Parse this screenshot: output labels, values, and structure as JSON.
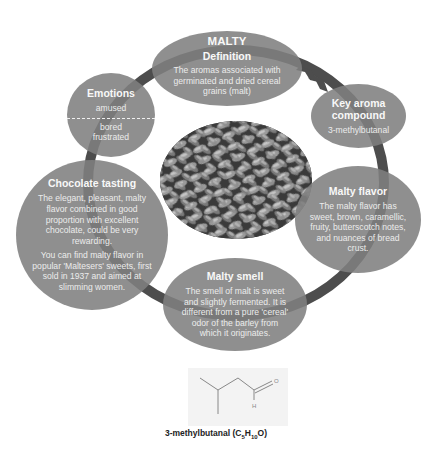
{
  "diagram": {
    "title": "MALTY",
    "colors": {
      "bubble_fill": "#808080",
      "ring": "#4d4d4d",
      "text": "#f2f2f2",
      "caption": "#222222",
      "background": "#ffffff"
    },
    "nodes": {
      "definition": {
        "title": "Definition",
        "body": "The aromas associated with germinated and dried cereal grains (malt)"
      },
      "key_aroma": {
        "title": "Key aroma compound",
        "body": "3-methylbutanal"
      },
      "malty_flavor": {
        "title": "Malty flavor",
        "body": "The malty flavor has sweet, brown, caramellic, fruity, butterscotch notes, and nuances of bread crust."
      },
      "malty_smell": {
        "title": "Malty smell",
        "body": "The smell of malt is sweet and slightly fermented. It is different from a pure 'cereal' odor of the barley from which it originates."
      },
      "chocolate": {
        "title": "Chocolate tasting",
        "body1": "The elegant, pleasant, malty flavor combined in good proportion with excellent chocolate, could be very rewarding.",
        "body2": "You can find malty flavor in popular 'Maltesers' sweets, first sold in 1937 and aimed at slimming women."
      },
      "emotions": {
        "title": "Emotions",
        "positive": "amused",
        "negative1": "bored",
        "negative2": "frustrated"
      }
    },
    "center_image": "malt-grains-photo",
    "molecule": {
      "atom_o": "O",
      "atom_h": "H",
      "caption_prefix": "3-methylbutanal (C",
      "sub1": "5",
      "mid": "H",
      "sub2": "10",
      "suffix": "O)"
    }
  }
}
